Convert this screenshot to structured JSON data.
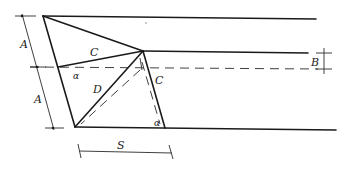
{
  "diagram": {
    "type": "geometric-construction",
    "labels": {
      "dim_a_upper": "A",
      "dim_a_lower": "A",
      "dim_b": "B",
      "dim_s": "S",
      "segment_c_left": "C",
      "segment_c_right": "C",
      "segment_d": "D",
      "angle_left": "α",
      "angle_bottom": "α"
    },
    "colors": {
      "line": "#1a1a1a",
      "background": "#ffffff"
    }
  }
}
